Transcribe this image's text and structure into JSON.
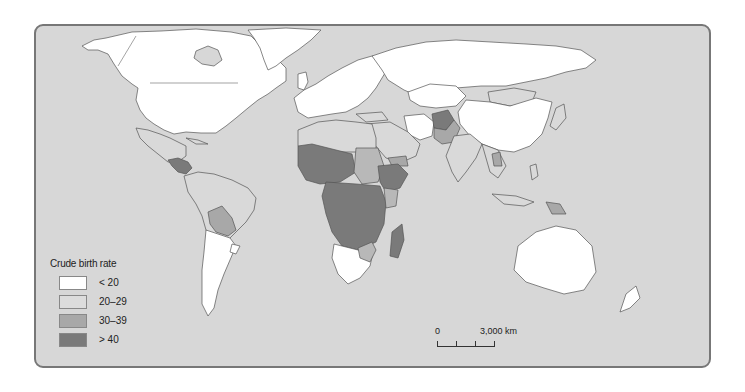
{
  "map": {
    "title": "Crude birth rate world map",
    "background_color": "#d7d7d7",
    "colors": {
      "lt20": "#ffffff",
      "20_29": "#d9d9d9",
      "30_39": "#a9a9a9",
      "gt40": "#7b7b7b",
      "border": "#555555"
    }
  },
  "legend": {
    "title": "Crude birth rate",
    "items": [
      {
        "label": "< 20",
        "color": "#ffffff"
      },
      {
        "label": "20–29",
        "color": "#dcdcdc"
      },
      {
        "label": "30–39",
        "color": "#a8a8a8"
      },
      {
        "label": "> 40",
        "color": "#7a7a7a"
      }
    ]
  },
  "scale_bar": {
    "start_label": "0",
    "end_label": "3,000 km"
  }
}
